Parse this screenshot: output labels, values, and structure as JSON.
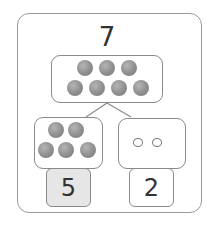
{
  "whole": {
    "value": "7",
    "balls": 7
  },
  "parts": [
    {
      "value": "5",
      "balls": 5,
      "filled": true,
      "highlighted": true
    },
    {
      "value": "2",
      "balls": 2,
      "filled": false,
      "highlighted": false
    }
  ],
  "colors": {
    "border": "#8a8a8a",
    "ball": "#8e8e8e",
    "highlight": "#e6e6e6",
    "text": "#333333"
  }
}
